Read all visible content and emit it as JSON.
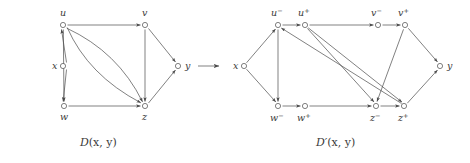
{
  "figure": {
    "kind": "directed-graph-transformation",
    "arrow_glyph": "→",
    "left": {
      "caption_main": "D",
      "caption_args": "(x, y)",
      "nodes": [
        {
          "id": "x",
          "label": "x",
          "sup": "",
          "cx": 63,
          "cy": 66,
          "lx": 52,
          "ly": 69
        },
        {
          "id": "u",
          "label": "u",
          "sup": "",
          "cx": 63,
          "cy": 25,
          "lx": 60,
          "ly": 16
        },
        {
          "id": "v",
          "label": "v",
          "sup": "",
          "cx": 145,
          "cy": 25,
          "lx": 142,
          "ly": 16
        },
        {
          "id": "w",
          "label": "w",
          "sup": "",
          "cx": 64,
          "cy": 106,
          "lx": 60,
          "ly": 120
        },
        {
          "id": "z",
          "label": "z",
          "sup": "",
          "cx": 145,
          "cy": 106,
          "lx": 142,
          "ly": 120
        },
        {
          "id": "y",
          "label": "y",
          "sup": "",
          "cx": 178,
          "cy": 66,
          "lx": 185,
          "ly": 69
        }
      ],
      "edges": [
        {
          "from": "x",
          "to": "u",
          "shape": "line"
        },
        {
          "from": "x",
          "to": "w",
          "shape": "line"
        },
        {
          "from": "u",
          "to": "v",
          "shape": "line"
        },
        {
          "from": "u",
          "to": "w",
          "shape": "line"
        },
        {
          "from": "u",
          "to": "z",
          "shape": "curve-upper"
        },
        {
          "from": "u",
          "to": "z",
          "shape": "curve-lower"
        },
        {
          "from": "w",
          "to": "z",
          "shape": "line"
        },
        {
          "from": "v",
          "to": "z",
          "shape": "line"
        },
        {
          "from": "v",
          "to": "y",
          "shape": "line"
        },
        {
          "from": "z",
          "to": "y",
          "shape": "line"
        }
      ]
    },
    "right": {
      "caption_main": "D′",
      "caption_args": "(x, y)",
      "nodes": [
        {
          "id": "x",
          "label": "x",
          "sup": "",
          "cx": 244,
          "cy": 66,
          "lx": 233,
          "ly": 69
        },
        {
          "id": "u-",
          "label": "u",
          "sup": "−",
          "cx": 278,
          "cy": 25,
          "lx": 271,
          "ly": 16
        },
        {
          "id": "u+",
          "label": "u",
          "sup": "+",
          "cx": 305,
          "cy": 25,
          "lx": 298,
          "ly": 16
        },
        {
          "id": "v-",
          "label": "v",
          "sup": "−",
          "cx": 378,
          "cy": 25,
          "lx": 371,
          "ly": 16
        },
        {
          "id": "v+",
          "label": "v",
          "sup": "+",
          "cx": 405,
          "cy": 25,
          "lx": 398,
          "ly": 16
        },
        {
          "id": "w-",
          "label": "w",
          "sup": "−",
          "cx": 278,
          "cy": 106,
          "lx": 270,
          "ly": 121
        },
        {
          "id": "w+",
          "label": "w",
          "sup": "+",
          "cx": 305,
          "cy": 106,
          "lx": 297,
          "ly": 121
        },
        {
          "id": "z-",
          "label": "z",
          "sup": "−",
          "cx": 376,
          "cy": 106,
          "lx": 369,
          "ly": 121
        },
        {
          "id": "z+",
          "label": "z",
          "sup": "+",
          "cx": 404,
          "cy": 106,
          "lx": 397,
          "ly": 121
        },
        {
          "id": "y",
          "label": "y",
          "sup": "",
          "cx": 440,
          "cy": 66,
          "lx": 448,
          "ly": 69
        }
      ],
      "edges": [
        {
          "from": "x",
          "to": "u-",
          "shape": "line"
        },
        {
          "from": "x",
          "to": "w-",
          "shape": "line"
        },
        {
          "from": "u-",
          "to": "u+",
          "shape": "line"
        },
        {
          "from": "u+",
          "to": "v-",
          "shape": "line"
        },
        {
          "from": "v-",
          "to": "v+",
          "shape": "line"
        },
        {
          "from": "u-",
          "to": "w-",
          "shape": "line"
        },
        {
          "from": "u+",
          "to": "z-",
          "shape": "line"
        },
        {
          "from": "u+",
          "to": "z+",
          "shape": "line"
        },
        {
          "from": "z+",
          "to": "u-",
          "shape": "line"
        },
        {
          "from": "w-",
          "to": "w+",
          "shape": "line"
        },
        {
          "from": "w+",
          "to": "z-",
          "shape": "line"
        },
        {
          "from": "z-",
          "to": "z+",
          "shape": "line"
        },
        {
          "from": "v+",
          "to": "z-",
          "shape": "line"
        },
        {
          "from": "v+",
          "to": "y",
          "shape": "line"
        },
        {
          "from": "z+",
          "to": "y",
          "shape": "line"
        }
      ]
    }
  },
  "colors": {
    "stroke": "#4a4a4a",
    "text": "#3a3a3a",
    "background": "#ffffff"
  }
}
